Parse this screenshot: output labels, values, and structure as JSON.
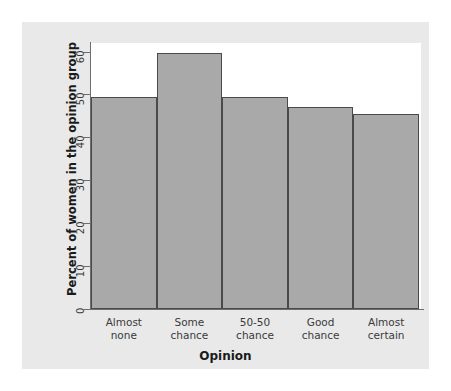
{
  "chart_data": {
    "type": "bar",
    "title": "",
    "xlabel": "Opinion",
    "ylabel": "Percent of women in the opinion group",
    "categories": [
      "Almost none",
      "Some chance",
      "50-50 chance",
      "Good chance",
      "Almost certain"
    ],
    "category_lines": [
      [
        "Almost",
        "none"
      ],
      [
        "Some",
        "chance"
      ],
      [
        "50-50",
        "chance"
      ],
      [
        "Good",
        "chance"
      ],
      [
        "Almost",
        "certain"
      ]
    ],
    "values": [
      49.5,
      59.7,
      49.5,
      47.0,
      45.5
    ],
    "ylim": [
      0,
      62
    ],
    "yticks": [
      0,
      10,
      20,
      30,
      40,
      50,
      60
    ],
    "ytick_labels": [
      "0",
      "10",
      "20",
      "30",
      "40",
      "50",
      "60"
    ],
    "grid": false,
    "legend": null,
    "bar_color": "#a9a9a9",
    "bar_border_color": "#4a4a4a",
    "panel_color": "#e9e9e9",
    "plot_background": "#ffffff",
    "axis_color": "#6e6e6e"
  }
}
